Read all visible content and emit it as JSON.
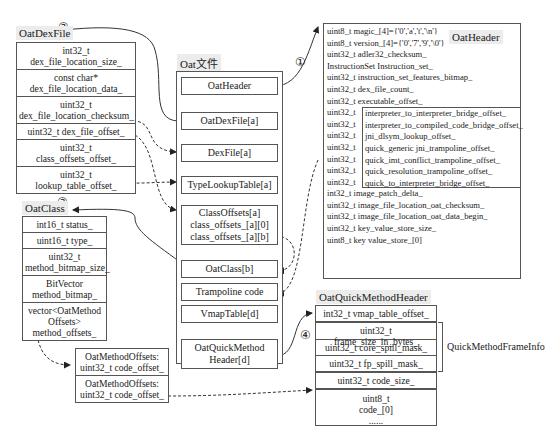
{
  "diagram": {
    "oat_file": {
      "title": "Oat文件",
      "items": [
        "OatHeader",
        "OatDexFile[a]",
        "DexFile[a]",
        "TypeLookupTable[a]",
        "ClassOffsets[a]",
        "class_offsets_[a][0]",
        "class_offsets_[a][b]",
        "OatClass[b]",
        "Trampoline code",
        "VmapTable[d]",
        "OatQuickMethod",
        "Header[d]"
      ]
    },
    "oat_dex_file": {
      "title": "OatDexFile",
      "fields": [
        "int32_t dex_file_location_size_",
        "const char*",
        "dex_file_location_data_",
        "uint32_t",
        "dex_file_location_checksum_",
        "uint32_t dex_file_offset_",
        "uint32_t class_offsets_offset_",
        "uint32_t lookup_table_offset_"
      ]
    },
    "oat_class": {
      "title": "OatClass",
      "fields": [
        "int16_t status_",
        "uint16_t type_",
        "uint32_t",
        "method_bitmap_size_",
        "BitVector",
        "method_bitmap_",
        "vector<OatMethod",
        "Offsets>",
        "method_offsets_"
      ]
    },
    "oat_method_offsets": {
      "entries": [
        "OatMethodOffsets:",
        "uint32_t code_offset_",
        "OatMethodOffsets:",
        "uint32_t code_offset_"
      ]
    },
    "oat_header": {
      "title": "OatHeader",
      "fields": [
        "uint8_t magic_[4]={'0','a','t','\\n'}",
        "uint8_t version_[4]={'0','7','9','\\0'}",
        "uint32_t adler32_checksum_",
        "InstructionSet Instruction_set_",
        "uint32_t instruction_set_features_bitmap_",
        "uint32_t dex_file_count_",
        "uint32_t executable_offset_",
        "uint32_t",
        "interpreter_to_interpreter_bridge_offset_",
        "interpreter_to_compiled_code_bridge_offset_",
        "jni_dlsym_lookup_offset_",
        "quick_generic jni_trampoline_offset_",
        "quick_imt_conflict_trampoline_offset_",
        "quick_resolution_trampoline_offset_",
        "quick_to_interpreter_bridge_offset_",
        "int32_t image_patch_delta_",
        "uint32_t image_file_location_oat_checksum_",
        "uint32_t image_file_location_oat_data_begin_",
        "uint32_t key_value_store_size_",
        "uint8_t key value_store_[0]"
      ]
    },
    "oat_quick_method_header": {
      "title": "OatQuickMethodHeader",
      "fields": [
        "int32_t vmap_table_offset_",
        "uint32_t frame_size_in_bytes_",
        "uint32_t core_spill_mask_",
        "uint32_t fp_spill_mask_",
        "uint32_t code_size_",
        "uint8_t",
        "code_[0]",
        "......"
      ],
      "frame_info_label": "QuickMethodFrameInfo"
    },
    "markers": [
      "①",
      "②",
      "③",
      "④"
    ]
  }
}
